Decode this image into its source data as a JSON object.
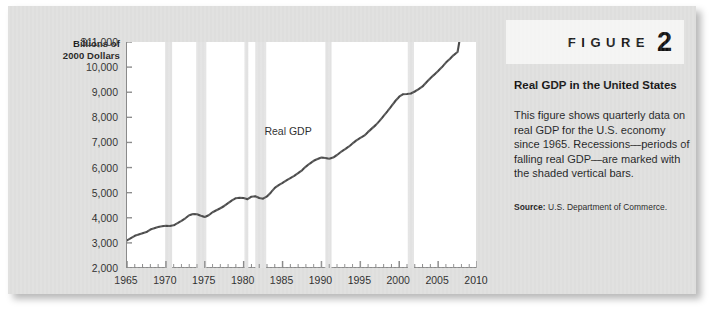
{
  "figure": {
    "word": "FIGURE",
    "number": "2",
    "caption_title": "Real GDP in the United States",
    "caption_body": "This figure shows quarterly data on real GDP for the U.S. economy since 1965. Recessions—periods of falling real GDP—are marked with the shaded vertical bars.",
    "source_label": "Source:",
    "source_text": "U.S. Department of Commerce."
  },
  "chart_data": {
    "type": "line",
    "title": "Real GDP in the United States",
    "xlabel": "",
    "ylabel": "Billions of 2000 Dollars",
    "ylabel_lines": [
      "Billions of",
      "2000 Dollars"
    ],
    "xlim": [
      1965,
      2010
    ],
    "ylim": [
      2000,
      11000
    ],
    "grid": false,
    "legend_position": "inline-annotation",
    "series_annotation": "Real GDP",
    "ytick_labels": [
      "$11,000",
      "10,000",
      "9,000",
      "8,000",
      "7,000",
      "6,000",
      "5,000",
      "4,000",
      "3,000",
      "2,000"
    ],
    "yticks": [
      11000,
      10000,
      9000,
      8000,
      7000,
      6000,
      5000,
      4000,
      3000,
      2000
    ],
    "xtick_labels": [
      "1965",
      "1970",
      "1975",
      "1980",
      "1985",
      "1990",
      "1995",
      "2000",
      "2005",
      "2010"
    ],
    "xticks": [
      1965,
      1970,
      1975,
      1980,
      1985,
      1990,
      1995,
      2000,
      2005,
      2010
    ],
    "minor_xtick_interval": 1,
    "series": [
      {
        "name": "Real GDP",
        "color": "#4a4a4a",
        "x": [
          1965,
          1965.5,
          1966,
          1966.5,
          1967,
          1967.5,
          1968,
          1968.5,
          1969,
          1969.5,
          1970,
          1970.5,
          1971,
          1971.5,
          1972,
          1972.5,
          1973,
          1973.5,
          1974,
          1974.5,
          1975,
          1975.5,
          1976,
          1976.5,
          1977,
          1977.5,
          1978,
          1978.5,
          1979,
          1979.5,
          1980,
          1980.5,
          1981,
          1981.5,
          1982,
          1982.5,
          1983,
          1983.5,
          1984,
          1984.5,
          1985,
          1985.5,
          1986,
          1986.5,
          1987,
          1987.5,
          1988,
          1988.5,
          1989,
          1989.5,
          1990,
          1990.5,
          1991,
          1991.5,
          1992,
          1992.5,
          1993,
          1993.5,
          1994,
          1994.5,
          1995,
          1995.5,
          1996,
          1996.5,
          1997,
          1997.5,
          1998,
          1998.5,
          1999,
          1999.5,
          2000,
          2000.5,
          2001,
          2001.5,
          2002,
          2002.5,
          2003,
          2003.5,
          2004,
          2004.5,
          2005,
          2005.5,
          2006,
          2006.5,
          2007,
          2007.5,
          2008
        ],
        "y": [
          3100,
          3190,
          3280,
          3330,
          3380,
          3430,
          3530,
          3580,
          3630,
          3660,
          3680,
          3670,
          3700,
          3790,
          3880,
          3980,
          4100,
          4150,
          4140,
          4080,
          4030,
          4100,
          4220,
          4300,
          4380,
          4470,
          4580,
          4690,
          4780,
          4800,
          4790,
          4740,
          4840,
          4860,
          4790,
          4760,
          4850,
          5010,
          5190,
          5300,
          5390,
          5490,
          5580,
          5670,
          5780,
          5890,
          6040,
          6160,
          6270,
          6340,
          6400,
          6380,
          6350,
          6400,
          6500,
          6620,
          6720,
          6830,
          6960,
          7080,
          7180,
          7270,
          7420,
          7560,
          7700,
          7870,
          8060,
          8250,
          8450,
          8650,
          8820,
          8920,
          8930,
          8950,
          9030,
          9120,
          9230,
          9400,
          9560,
          9700,
          9850,
          10000,
          10180,
          10320,
          10480,
          10600,
          11500
        ]
      }
    ],
    "recession_bands": [
      {
        "start": 1969.9,
        "end": 1970.8,
        "label": "1969-70 recession"
      },
      {
        "start": 1973.9,
        "end": 1975.2,
        "label": "1973-75 recession"
      },
      {
        "start": 1980.1,
        "end": 1980.6,
        "label": "1980 recession"
      },
      {
        "start": 1981.5,
        "end": 1982.9,
        "label": "1981-82 recession"
      },
      {
        "start": 1990.5,
        "end": 1991.3,
        "label": "1990-91 recession"
      },
      {
        "start": 2001.1,
        "end": 2001.9,
        "label": "2001 recession"
      }
    ],
    "recession_band_color": "#e2e2e2"
  },
  "colors": {
    "card_background": "#dededd",
    "plot_background": "#ffffff",
    "line": "#4a4a4a",
    "axis": "#8a8a8a",
    "recession_band": "#e2e2e2",
    "text": "#1b1b1b"
  }
}
